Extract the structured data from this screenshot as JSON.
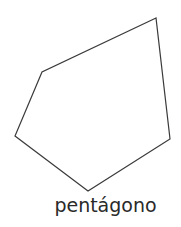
{
  "shape": {
    "name": "pentagon",
    "points": [
      [
        156,
        18
      ],
      [
        42,
        72
      ],
      [
        15,
        136
      ],
      [
        88,
        191
      ],
      [
        170,
        139
      ]
    ],
    "stroke": "#3a3a3a",
    "fill": "#ffffff"
  },
  "label": "pentágono"
}
